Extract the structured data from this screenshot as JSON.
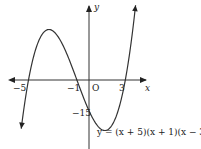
{
  "chart_data": {
    "type": "line",
    "title": "",
    "equation": "y = (x + 5)(x + 1)(x − 3)",
    "xlabel": "x",
    "ylabel": "y",
    "origin_label": "O",
    "x_ticks": [
      {
        "value": -5,
        "label": "−5"
      },
      {
        "value": -1,
        "label": "−1"
      },
      {
        "value": 3,
        "label": "3"
      }
    ],
    "y_ticks": [
      {
        "value": -15,
        "label": "−15"
      }
    ],
    "roots": [
      -5,
      -1,
      3
    ],
    "y_intercept": -15,
    "xlim": [
      -6.6,
      4.9
    ],
    "ylim": [
      -32,
      37
    ],
    "grid": false,
    "series": [
      {
        "name": "y = (x + 5)(x + 1)(x − 3)",
        "function": "(x+5)*(x+1)*(x-3)",
        "x_range": [
          -5.6,
          3.85
        ]
      }
    ]
  },
  "labels": {
    "x_axis": "x",
    "y_axis": "y",
    "origin": "O",
    "tick_m5": "−5",
    "tick_m1": "−1",
    "tick_3": "3",
    "tick_m15": "−15",
    "equation": "y = (x + 5)(x + 1)(x − 3)"
  }
}
